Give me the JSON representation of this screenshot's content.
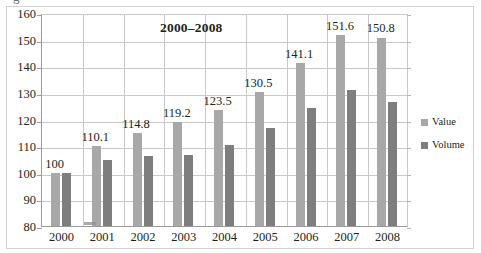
{
  "chart_data": {
    "type": "bar",
    "title": "2000–2008",
    "xlabel": "",
    "ylabel": "",
    "categories": [
      "2000",
      "2001",
      "2002",
      "2003",
      "2004",
      "2005",
      "2006",
      "2007",
      "2008"
    ],
    "series": [
      {
        "name": "Value",
        "color": "#a8a8a8",
        "values": [
          100,
          110.1,
          114.8,
          119.2,
          123.5,
          130.5,
          141.1,
          151.6,
          150.8
        ],
        "labels": [
          "100",
          "110.1",
          "114.8",
          "119.2",
          "123.5",
          "130.5",
          "141.1",
          "151.6",
          "150.8"
        ]
      },
      {
        "name": "Volume",
        "color": "#7e7e7e",
        "values": [
          100,
          104.8,
          106.2,
          106.8,
          110.3,
          117.0,
          124.2,
          131.2,
          126.5
        ],
        "labels": [
          "",
          "",
          "",
          "",
          "",
          "",
          "",
          "",
          ""
        ]
      }
    ],
    "ylim": [
      80,
      160
    ],
    "ytick_step": 10,
    "yticks": [
      "160",
      "150",
      "140",
      "130",
      "120",
      "110",
      "100",
      "90",
      "80"
    ],
    "grid": true,
    "legend_position": "right",
    "data_labels_shown_for": "Value"
  },
  "legend": {
    "items": [
      {
        "label": "Value",
        "color": "#a8a8a8"
      },
      {
        "label": "Volume",
        "color": "#7e7e7e"
      }
    ]
  },
  "artifacts": {
    "top_crop_glyph": "g"
  }
}
